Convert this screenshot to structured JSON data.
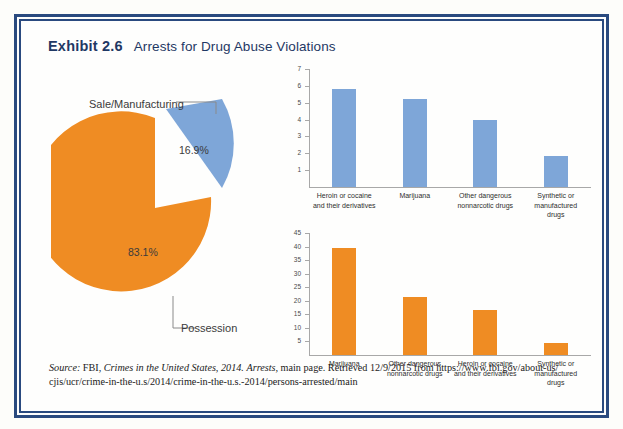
{
  "exhibit": {
    "number": "Exhibit 2.6",
    "title": "Arrests for Drug Abuse Violations"
  },
  "colors": {
    "frame": "#2a4a7f",
    "heading": "#1f3864",
    "blue": "#7ea6d8",
    "orange": "#ef8c23",
    "axis": "#a8a8a8"
  },
  "source": {
    "label": "Source:",
    "agency": "FBI,",
    "publication": "Crimes in the United States, 2014.",
    "section": "Arrests,",
    "rest": "main page. Retrieved 12/9/2015 from https://www.fbi.gov/about-us/",
    "line2": "cjis/ucr/crime-in-the-u.s/2014/crime-in-the-u.s.-2014/persons-arrested/main"
  },
  "chart_data": [
    {
      "type": "pie",
      "title": "",
      "labels": [
        "Sale/Manufacturing",
        "Possession"
      ],
      "values": [
        16.9,
        83.1
      ],
      "value_labels": [
        "16.9%",
        "83.1%"
      ],
      "colors": [
        "#7ea6d8",
        "#ef8c23"
      ],
      "exploded": [
        "Sale/Manufacturing"
      ],
      "legend": "none"
    },
    {
      "type": "bar",
      "title": "",
      "categories": [
        "Heroin or cocaine\nand their derivatives",
        "Marijuana",
        "Other dangerous\nnonnarcotic drugs",
        "Synthetic or\nmanufactured\ndrugs"
      ],
      "category_lines": [
        [
          "Heroin or cocaine",
          "and their derivatives"
        ],
        [
          "Marijuana"
        ],
        [
          "Other dangerous",
          "nonnarcotic drugs"
        ],
        [
          "Synthetic or",
          "manufactured",
          "drugs"
        ]
      ],
      "values": [
        5.8,
        5.2,
        4.0,
        1.85
      ],
      "color": "#7ea6d8",
      "ylim": [
        0,
        7
      ],
      "yticks": [
        1,
        2,
        3,
        4,
        5,
        6,
        7
      ],
      "xlabel": "",
      "ylabel": "",
      "grid": false,
      "legend": "none"
    },
    {
      "type": "bar",
      "title": "",
      "categories": [
        "Marijuana",
        "Other dangerous\nnonnarcotic drugs",
        "Heroin or cocaine\nand their derivatives",
        "Synthetic or\nmanufactured\ndrugs"
      ],
      "category_lines": [
        [
          "Marijuana"
        ],
        [
          "Other dangerous",
          "nonnarcotic drugs"
        ],
        [
          "Heroin or cocaine",
          "and their derivatives"
        ],
        [
          "Synthetic or",
          "manufactured",
          "drugs"
        ]
      ],
      "values": [
        39.5,
        21.3,
        16.7,
        4.5
      ],
      "color": "#ef8c23",
      "ylim": [
        0,
        45
      ],
      "yticks": [
        5,
        10,
        15,
        20,
        25,
        30,
        35,
        40,
        45
      ],
      "xlabel": "",
      "ylabel": "",
      "grid": false,
      "legend": "none"
    }
  ]
}
